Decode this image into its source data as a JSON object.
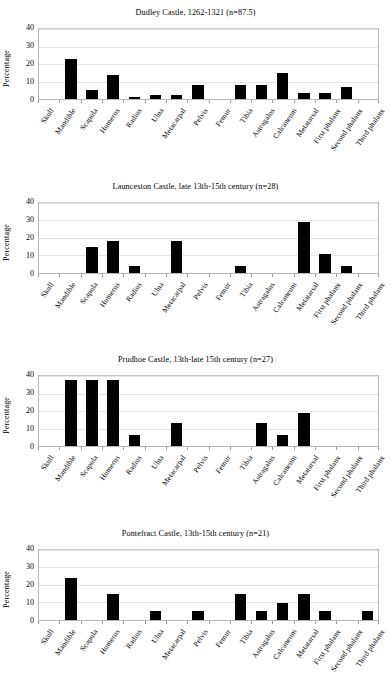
{
  "figure": {
    "y_axis_label": "Percentage",
    "y_ticks": [
      "0",
      "10",
      "20",
      "30",
      "40"
    ],
    "categories": [
      "Skull",
      "Mandible",
      "Scapula",
      "Humerus",
      "Radius",
      "Ulna",
      "Metacarpal",
      "Pelvis",
      "Femur",
      "Tibia",
      "Astragalus",
      "Calcaneum",
      "Metatarsal",
      "First phalanx",
      "Second phalanx",
      "Third phalanx"
    ],
    "bar_color": "#000000"
  },
  "chart_data": [
    {
      "type": "bar",
      "title": "Dudley Castle, 1262-1321 (n=87.5)",
      "xlabel": "",
      "ylabel": "Percentage",
      "ylim": [
        0,
        40
      ],
      "yticks": [
        0,
        10,
        20,
        30,
        40
      ],
      "grid": true,
      "legend": "none",
      "categories": [
        "Skull",
        "Mandible",
        "Scapula",
        "Humerus",
        "Radius",
        "Ulna",
        "Metacarpal",
        "Pelvis",
        "Femur",
        "Tibia",
        "Astragalus",
        "Calcaneum",
        "Metatarsal",
        "First phalanx",
        "Second phalanx",
        "Third phalanx"
      ],
      "values": [
        0,
        23,
        5,
        14,
        1,
        2.3,
        2.3,
        8,
        0,
        8,
        8,
        15,
        3.5,
        3.5,
        7,
        0
      ]
    },
    {
      "type": "bar",
      "title": "Launceston Castle, late 13th-15th century (n=28)",
      "xlabel": "",
      "ylabel": "Percentage",
      "ylim": [
        0,
        40
      ],
      "yticks": [
        0,
        10,
        20,
        30,
        40
      ],
      "grid": true,
      "legend": "none",
      "categories": [
        "Skull",
        "Mandible",
        "Scapula",
        "Humerus",
        "Radius",
        "Ulna",
        "Metacarpal",
        "Pelvis",
        "Femur",
        "Tibia",
        "Astragalus",
        "Calcaneum",
        "Metatarsal",
        "First phalanx",
        "Second phalanx",
        "Third phalanx"
      ],
      "values": [
        0,
        0,
        14.3,
        18,
        3.6,
        0,
        18,
        0,
        0,
        3.6,
        0,
        0,
        28.6,
        10.7,
        3.6,
        0
      ]
    },
    {
      "type": "bar",
      "title": "Prudhoe Castle, 13th-late 15th century (n=27)",
      "xlabel": "",
      "ylabel": "Percentage",
      "ylim": [
        0,
        40
      ],
      "yticks": [
        0,
        10,
        20,
        30,
        40
      ],
      "grid": true,
      "legend": "none",
      "categories": [
        "Skull",
        "Mandible",
        "Scapula",
        "Humerus",
        "Radius",
        "Ulna",
        "Metacarpal",
        "Pelvis",
        "Femur",
        "Tibia",
        "Astragalus",
        "Calcaneum",
        "Metatarsal",
        "First phalanx",
        "Second phalanx",
        "Third phalanx"
      ],
      "values": [
        0,
        37.9,
        37.9,
        37.9,
        6.5,
        0,
        12.9,
        0,
        0,
        0,
        12.9,
        6.5,
        19,
        0,
        0,
        0
      ]
    },
    {
      "type": "bar",
      "title": "Pontefract Castle, 13th-15th century (n=21)",
      "xlabel": "",
      "ylabel": "Percentage",
      "ylim": [
        0,
        40
      ],
      "yticks": [
        0,
        10,
        20,
        30,
        40
      ],
      "grid": true,
      "legend": "none",
      "categories": [
        "Skull",
        "Mandible",
        "Scapula",
        "Humerus",
        "Radius",
        "Ulna",
        "Metacarpal",
        "Pelvis",
        "Femur",
        "Tibia",
        "Astragalus",
        "Calcaneum",
        "Metatarsal",
        "First phalanx",
        "Second phalanx",
        "Third phalanx"
      ],
      "values": [
        0,
        23.8,
        0,
        14.3,
        0,
        4.8,
        0,
        4.8,
        0,
        14.3,
        4.8,
        9.5,
        14.3,
        4.8,
        0,
        4.8
      ]
    }
  ]
}
